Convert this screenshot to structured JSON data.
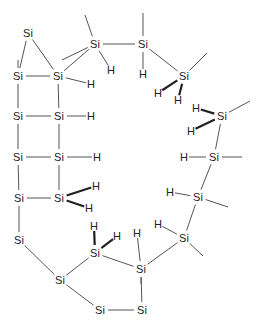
{
  "diagram": {
    "type": "chemical-structure",
    "line_color": "#555555",
    "text_color": "#222222",
    "atoms": [
      {
        "id": "si1",
        "label": "Si",
        "x": 28,
        "y": 33
      },
      {
        "id": "si2",
        "label": "Si",
        "x": 18,
        "y": 76
      },
      {
        "id": "si3",
        "label": "Si",
        "x": 58,
        "y": 76
      },
      {
        "id": "si4",
        "label": "Si",
        "x": 95,
        "y": 44
      },
      {
        "id": "si5",
        "label": "Si",
        "x": 143,
        "y": 44
      },
      {
        "id": "si6",
        "label": "Si",
        "x": 184,
        "y": 76
      },
      {
        "id": "si7",
        "label": "Si",
        "x": 18,
        "y": 116
      },
      {
        "id": "si8",
        "label": "Si",
        "x": 59,
        "y": 116
      },
      {
        "id": "si9",
        "label": "Si",
        "x": 18,
        "y": 157
      },
      {
        "id": "si10",
        "label": "Si",
        "x": 59,
        "y": 157
      },
      {
        "id": "si11",
        "label": "Si",
        "x": 19,
        "y": 198
      },
      {
        "id": "si12",
        "label": "Si",
        "x": 59,
        "y": 198
      },
      {
        "id": "si13",
        "label": "Si",
        "x": 19,
        "y": 240
      },
      {
        "id": "si14",
        "label": "Si",
        "x": 222,
        "y": 116
      },
      {
        "id": "si15",
        "label": "Si",
        "x": 214,
        "y": 157
      },
      {
        "id": "si16",
        "label": "Si",
        "x": 198,
        "y": 197
      },
      {
        "id": "si17",
        "label": "Si",
        "x": 184,
        "y": 238
      },
      {
        "id": "si18",
        "label": "Si",
        "x": 95,
        "y": 253
      },
      {
        "id": "si19",
        "label": "Si",
        "x": 141,
        "y": 269
      },
      {
        "id": "si20",
        "label": "Si",
        "x": 60,
        "y": 280
      },
      {
        "id": "si21",
        "label": "Si",
        "x": 100,
        "y": 310
      },
      {
        "id": "si22",
        "label": "Si",
        "x": 142,
        "y": 310
      },
      {
        "id": "h1",
        "label": "H",
        "x": 111,
        "y": 70
      },
      {
        "id": "h2",
        "label": "H",
        "x": 91,
        "y": 84
      },
      {
        "id": "h3",
        "label": "H",
        "x": 143,
        "y": 74
      },
      {
        "id": "h4",
        "label": "H",
        "x": 158,
        "y": 93
      },
      {
        "id": "h5",
        "label": "H",
        "x": 178,
        "y": 100
      },
      {
        "id": "h6",
        "label": "H",
        "x": 91,
        "y": 116
      },
      {
        "id": "h7",
        "label": "H",
        "x": 97,
        "y": 157
      },
      {
        "id": "h8",
        "label": "H",
        "x": 96,
        "y": 186
      },
      {
        "id": "h9",
        "label": "H",
        "x": 89,
        "y": 208
      },
      {
        "id": "h10",
        "label": "H",
        "x": 196,
        "y": 108
      },
      {
        "id": "h11",
        "label": "H",
        "x": 191,
        "y": 131
      },
      {
        "id": "h12",
        "label": "H",
        "x": 184,
        "y": 157
      },
      {
        "id": "h13",
        "label": "H",
        "x": 170,
        "y": 192
      },
      {
        "id": "h14",
        "label": "H",
        "x": 158,
        "y": 224
      },
      {
        "id": "h15",
        "label": "H",
        "x": 94,
        "y": 226
      },
      {
        "id": "h16",
        "label": "H",
        "x": 117,
        "y": 236
      },
      {
        "id": "h17",
        "label": "H",
        "x": 137,
        "y": 233
      }
    ],
    "bonds": [
      {
        "a": "si1",
        "b": "si2",
        "style": "single"
      },
      {
        "a": "si1",
        "b": "si3",
        "style": "single"
      },
      {
        "a": "si2",
        "b": "si3",
        "style": "single"
      },
      {
        "a": "si3",
        "b": "si4",
        "style": "single"
      },
      {
        "a": "si4",
        "b": "si5",
        "style": "single"
      },
      {
        "a": "si5",
        "b": "si6",
        "style": "single"
      },
      {
        "a": "si2",
        "b": "si7",
        "style": "single"
      },
      {
        "a": "si3",
        "b": "si8",
        "style": "single"
      },
      {
        "a": "si7",
        "b": "si8",
        "style": "single"
      },
      {
        "a": "si7",
        "b": "si9",
        "style": "single"
      },
      {
        "a": "si8",
        "b": "si10",
        "style": "single"
      },
      {
        "a": "si9",
        "b": "si10",
        "style": "single"
      },
      {
        "a": "si9",
        "b": "si11",
        "style": "single"
      },
      {
        "a": "si10",
        "b": "si12",
        "style": "single"
      },
      {
        "a": "si11",
        "b": "si12",
        "style": "single"
      },
      {
        "a": "si11",
        "b": "si13",
        "style": "single"
      },
      {
        "a": "si13",
        "b": "si20",
        "style": "single"
      },
      {
        "a": "si20",
        "b": "si18",
        "style": "single"
      },
      {
        "a": "si20",
        "b": "si21",
        "style": "single"
      },
      {
        "a": "si21",
        "b": "si22",
        "style": "single"
      },
      {
        "a": "si22",
        "b": "si19",
        "style": "single"
      },
      {
        "a": "si18",
        "b": "si19",
        "style": "single"
      },
      {
        "a": "si19",
        "b": "si17",
        "style": "single"
      },
      {
        "a": "si17",
        "b": "si16",
        "style": "single"
      },
      {
        "a": "si16",
        "b": "si15",
        "style": "single"
      },
      {
        "a": "si15",
        "b": "si14",
        "style": "single"
      },
      {
        "a": "si3",
        "b": "h2",
        "style": "single"
      },
      {
        "a": "si4",
        "b": "h1",
        "style": "single"
      },
      {
        "a": "si5",
        "b": "h3",
        "style": "single"
      },
      {
        "a": "si6",
        "b": "h4",
        "style": "bold"
      },
      {
        "a": "si6",
        "b": "h5",
        "style": "bold"
      },
      {
        "a": "si8",
        "b": "h6",
        "style": "single"
      },
      {
        "a": "si10",
        "b": "h7",
        "style": "single"
      },
      {
        "a": "si12",
        "b": "h8",
        "style": "bold"
      },
      {
        "a": "si12",
        "b": "h9",
        "style": "bold"
      },
      {
        "a": "si14",
        "b": "h10",
        "style": "bold"
      },
      {
        "a": "si14",
        "b": "h11",
        "style": "bold"
      },
      {
        "a": "si15",
        "b": "h12",
        "style": "single"
      },
      {
        "a": "si16",
        "b": "h13",
        "style": "single"
      },
      {
        "a": "si17",
        "b": "h14",
        "style": "single"
      },
      {
        "a": "si18",
        "b": "h15",
        "style": "bold"
      },
      {
        "a": "si18",
        "b": "h16",
        "style": "bold"
      },
      {
        "a": "si19",
        "b": "h17",
        "style": "single"
      }
    ],
    "methyl_stubs": [
      {
        "from": "si4",
        "x2": 85,
        "y2": 15
      },
      {
        "from": "si4",
        "x2": 62,
        "y2": 60
      },
      {
        "from": "si5",
        "x2": 143,
        "y2": 13
      },
      {
        "from": "si6",
        "x2": 207,
        "y2": 53
      },
      {
        "from": "si14",
        "x2": 250,
        "y2": 101
      },
      {
        "from": "si15",
        "x2": 242,
        "y2": 157
      },
      {
        "from": "si16",
        "x2": 228,
        "y2": 207
      },
      {
        "from": "si17",
        "x2": 203,
        "y2": 256
      },
      {
        "from": "si19",
        "x2": 141,
        "y2": 284
      },
      {
        "from": "si2",
        "x2": 18,
        "y2": 60
      }
    ]
  }
}
